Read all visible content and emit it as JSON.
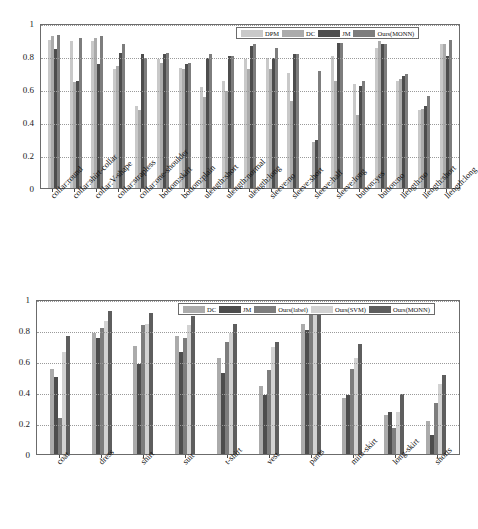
{
  "chart_data": [
    {
      "type": "bar",
      "title": "",
      "xlabel": "",
      "ylabel": "",
      "ylim": [
        0,
        1
      ],
      "yticks": [
        "0",
        "0.2",
        "0.4",
        "0.6",
        "0.8",
        "1"
      ],
      "grid": true,
      "legend_position": "top-right",
      "colors": {
        "DPM": "#c9c9c9",
        "DC": "#ababab",
        "JM": "#4d4d4d",
        "Ours(MONN)": "#7d7d7d"
      },
      "categories": [
        "collar:round",
        "collar:shirt-collar",
        "collar:V-shape",
        "collar:strapless",
        "collar:one-shoulder",
        "bottom:skirt",
        "bottom:plain",
        "ulength:short",
        "ulength:normal",
        "ulength:long",
        "sleeve:no",
        "sleeve:short",
        "sleeve:half",
        "sleeve:long",
        "button:yes",
        "button:no",
        "llength:no",
        "llength:short",
        "llength:long"
      ],
      "series": [
        {
          "name": "DPM",
          "values": [
            0.9,
            0.89,
            0.89,
            0.72,
            0.5,
            0.78,
            0.73,
            0.61,
            0.65,
            0.78,
            0.79,
            0.7,
            0.0,
            0.8,
            0.63,
            0.85,
            0.65,
            0.47,
            0.87
          ]
        },
        {
          "name": "DC",
          "values": [
            0.92,
            0.64,
            0.91,
            0.74,
            0.47,
            0.76,
            0.72,
            0.55,
            0.59,
            0.72,
            0.72,
            0.53,
            0.28,
            0.65,
            0.44,
            0.89,
            0.66,
            0.48,
            0.87
          ]
        },
        {
          "name": "JM",
          "values": [
            0.84,
            0.65,
            0.75,
            0.82,
            0.81,
            0.81,
            0.75,
            0.79,
            0.8,
            0.86,
            0.79,
            0.81,
            0.29,
            0.88,
            0.62,
            0.87,
            0.68,
            0.5,
            0.8
          ]
        },
        {
          "name": "Ours(MONN)",
          "values": [
            0.93,
            0.91,
            0.92,
            0.87,
            0.79,
            0.82,
            0.76,
            0.81,
            0.8,
            0.87,
            0.85,
            0.81,
            0.71,
            0.88,
            0.65,
            0.87,
            0.69,
            0.56,
            0.9
          ]
        }
      ],
      "legend": [
        "DPM",
        "DC",
        "JM",
        "Ours(MONN)"
      ]
    },
    {
      "type": "bar",
      "title": "",
      "xlabel": "",
      "ylabel": "",
      "ylim": [
        0,
        1
      ],
      "yticks": [
        "0",
        "0.2",
        "0.4",
        "0.6",
        "0.8",
        "1"
      ],
      "grid": true,
      "legend_position": "top-right",
      "colors": {
        "DC": "#ababab",
        "JM": "#4d4d4d",
        "Ours(label)": "#7d7d7d",
        "Ours(SVM)": "#d2d2d2",
        "Ours(MONN)": "#5e5e5e"
      },
      "categories": [
        "coat",
        "dress",
        "shirt",
        "suit",
        "t-shirt",
        "vest",
        "pants",
        "mini-skirt",
        "long-skirt",
        "shorts"
      ],
      "series": [
        {
          "name": "DC",
          "values": [
            0.55,
            0.78,
            0.7,
            0.76,
            0.62,
            0.44,
            0.84,
            0.36,
            0.25,
            0.21
          ]
        },
        {
          "name": "JM",
          "values": [
            0.5,
            0.75,
            0.58,
            0.66,
            0.52,
            0.38,
            0.8,
            0.38,
            0.27,
            0.12
          ]
        },
        {
          "name": "Ours(label)",
          "values": [
            0.23,
            0.81,
            0.83,
            0.75,
            0.72,
            0.54,
            0.9,
            0.55,
            0.17,
            0.33
          ]
        },
        {
          "name": "Ours(SVM)",
          "values": [
            0.66,
            0.86,
            0.84,
            0.83,
            0.78,
            0.69,
            0.91,
            0.62,
            0.27,
            0.45
          ]
        },
        {
          "name": "Ours(MONN)",
          "values": [
            0.76,
            0.92,
            0.91,
            0.89,
            0.84,
            0.72,
            0.93,
            0.71,
            0.39,
            0.51
          ]
        }
      ],
      "legend": [
        "DC",
        "JM",
        "Ours(label)",
        "Ours(SVM)",
        "Ours(MONN)"
      ]
    }
  ]
}
